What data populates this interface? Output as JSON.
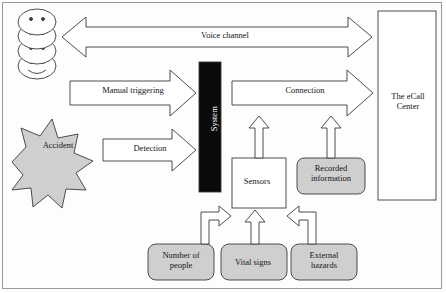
{
  "diagram": {
    "colors": {
      "shape_fill_gray": "#cfcfcf",
      "shape_fill_white": "#ffffff",
      "system_fill": "#0a0a0a",
      "stroke": "#3a3a3a",
      "frame_stroke": "#9a9a9a",
      "text": "#151515",
      "system_text": "#ffffff"
    },
    "nodes": {
      "people": {
        "label": "",
        "icon": "people-stack-icon",
        "count": 4
      },
      "accident": {
        "label": "Accident",
        "shape": "starburst",
        "fill": "gray"
      },
      "system": {
        "label": "System",
        "shape": "vertical-bar",
        "fill": "black",
        "text_orientation": "vertical"
      },
      "ecall_center": {
        "label": "The eCall\nCenter",
        "shape": "rectangle",
        "fill": "white"
      },
      "sensors": {
        "label": "Sensors",
        "shape": "rectangle",
        "fill": "white"
      },
      "recorded_information": {
        "label": "Recorded\ninformation",
        "shape": "rounded-rectangle",
        "fill": "gray"
      },
      "number_of_people": {
        "label": "Number of\npeople",
        "shape": "rounded-rectangle",
        "fill": "gray"
      },
      "vital_signs": {
        "label": "Vital signs",
        "shape": "rounded-rectangle",
        "fill": "gray"
      },
      "external_hazards": {
        "label": "External\nhazards",
        "shape": "rounded-rectangle",
        "fill": "gray"
      }
    },
    "arrows": {
      "voice_channel": {
        "label": "Voice channel",
        "style": "double-headed-block-arrow",
        "from": "people",
        "to": "ecall_center"
      },
      "manual_triggering": {
        "label": "Manual triggering",
        "style": "block-arrow-right",
        "from": "people",
        "to": "system"
      },
      "detection": {
        "label": "Detection",
        "style": "block-arrow-right",
        "from": "accident",
        "to": "system"
      },
      "connection": {
        "label": "Connection",
        "style": "block-arrow-right",
        "from": "system",
        "to": "ecall_center"
      },
      "sensors_to_connection": {
        "label": "",
        "style": "block-arrow-up",
        "from": "sensors",
        "to": "connection"
      },
      "recorded_to_connection": {
        "label": "",
        "style": "block-arrow-up",
        "from": "recorded_information",
        "to": "connection"
      },
      "people_to_sensors": {
        "label": "",
        "style": "block-arrow-elbow",
        "from": "number_of_people",
        "to": "sensors"
      },
      "vital_to_sensors": {
        "label": "",
        "style": "block-arrow-up",
        "from": "vital_signs",
        "to": "sensors"
      },
      "hazards_to_sensors": {
        "label": "",
        "style": "block-arrow-elbow",
        "from": "external_hazards",
        "to": "sensors"
      }
    }
  }
}
